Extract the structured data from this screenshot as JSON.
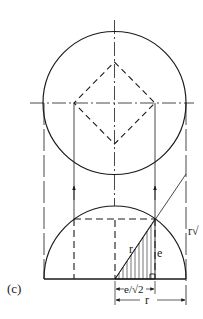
{
  "figure": {
    "panel_label": "(c)",
    "labels": {
      "hypotenuse": "r",
      "height": "e",
      "half_base": "e/√2",
      "radius_dim": "r",
      "side_label": "r√"
    },
    "colors": {
      "ink": "#1a1a1a",
      "background": "#ffffff"
    }
  }
}
